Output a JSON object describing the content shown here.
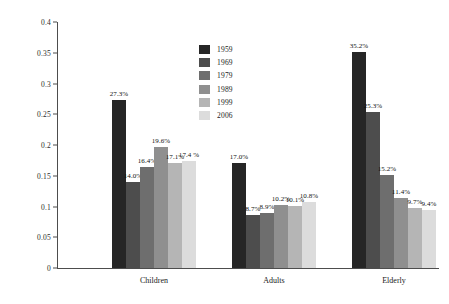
{
  "chart_data": {
    "type": "bar",
    "title": "",
    "subtitle": "",
    "xlabel": "",
    "ylabel": "",
    "categories": [
      "Children",
      "Adults",
      "Elderly"
    ],
    "ylim": [
      0,
      0.4
    ],
    "ytick_labels": [
      "0",
      "0.05",
      "0.1",
      "0.15",
      "0.2",
      "0.25",
      "0.3",
      "0.35",
      "0.4"
    ],
    "ytick_values": [
      0,
      0.05,
      0.1,
      0.15,
      0.2,
      0.25,
      0.3,
      0.35,
      0.4
    ],
    "grid": false,
    "legend_position": "upper-center",
    "series": [
      {
        "name": "1959",
        "color": "#262626",
        "values": [
          0.273,
          0.17,
          0.352
        ],
        "data_labels": [
          "27.3%",
          "17.0%",
          "35.2%"
        ]
      },
      {
        "name": "1969",
        "color": "#4d4d4d",
        "values": [
          0.14,
          0.087,
          0.253
        ],
        "data_labels": [
          "14.0%",
          "8.7%",
          "25.3%"
        ]
      },
      {
        "name": "1979",
        "color": "#6e6e6e",
        "values": [
          0.164,
          0.089,
          0.152
        ],
        "data_labels": [
          "16.4%",
          "8.9%",
          "15.2%"
        ]
      },
      {
        "name": "1989",
        "color": "#8f8f8f",
        "values": [
          0.196,
          0.102,
          0.114
        ],
        "data_labels": [
          "19.6%",
          "10.2%",
          "11.4%"
        ]
      },
      {
        "name": "1999",
        "color": "#b5b5b5",
        "values": [
          0.171,
          0.101,
          0.097
        ],
        "data_labels": [
          "17.1%",
          "10.1%",
          "9.7%"
        ]
      },
      {
        "name": "2006",
        "color": "#dcdcdc",
        "values": [
          0.174,
          0.108,
          0.094
        ],
        "data_labels": [
          "17.4 %",
          "10.8%",
          "9.4%"
        ]
      }
    ]
  }
}
